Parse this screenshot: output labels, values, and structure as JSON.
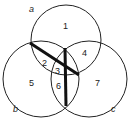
{
  "diagram": {
    "type": "venn",
    "sets": [
      {
        "label": "a"
      },
      {
        "label": "b"
      },
      {
        "label": "c"
      }
    ],
    "regions": [
      "1",
      "2",
      "3",
      "4",
      "5",
      "6",
      "7"
    ],
    "colors": {
      "stroke": "#222222",
      "background": "#ffffff"
    }
  }
}
